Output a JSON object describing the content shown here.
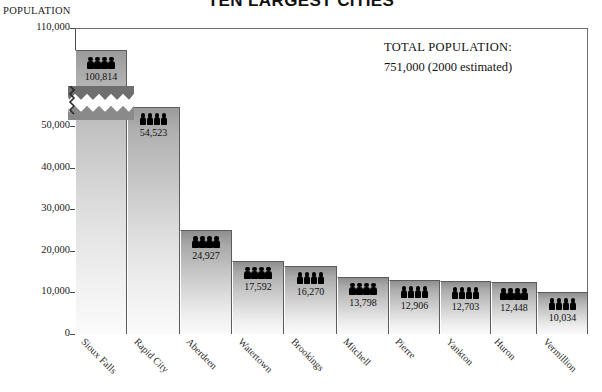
{
  "chart_data": {
    "type": "bar",
    "title": "TEN LARGEST CITIES",
    "ylabel": "POPULATION",
    "xlabel": "",
    "categories": [
      "Sioux Falls",
      "Rapid City",
      "Aberdeen",
      "Watertown",
      "Brookings",
      "Mitchell",
      "Pierre",
      "Yankton",
      "Huron",
      "Vermillion"
    ],
    "values": [
      100814,
      54523,
      24927,
      17592,
      16270,
      13798,
      12906,
      12703,
      12448,
      10034
    ],
    "value_labels": [
      "100,814",
      "54,523",
      "24,927",
      "17,592",
      "16,270",
      "13,798",
      "12,906",
      "12,703",
      "12,448",
      "10,034"
    ],
    "ylim": [
      0,
      110000
    ],
    "yticks": [
      0,
      10000,
      20000,
      30000,
      40000,
      50000,
      110000
    ],
    "ytick_labels": [
      "0",
      "10,000",
      "20,000",
      "30,000",
      "40,000",
      "50,000",
      "110,000"
    ],
    "axis_break": {
      "present": true,
      "between": [
        54000,
        100000
      ],
      "note": "zig-zag break on first bar and y axis"
    },
    "grid": false,
    "legend": null,
    "icon_per_bar": "people-icon",
    "icons_count_per_bar": 4,
    "bar_color_top": "#8e8e8e",
    "bar_color_bottom": "#fafafa"
  },
  "annotations": {
    "total_label": "TOTAL POPULATION:",
    "total_value": "751,000  (2000 estimated)"
  },
  "icons": {
    "people": "people-icon"
  }
}
